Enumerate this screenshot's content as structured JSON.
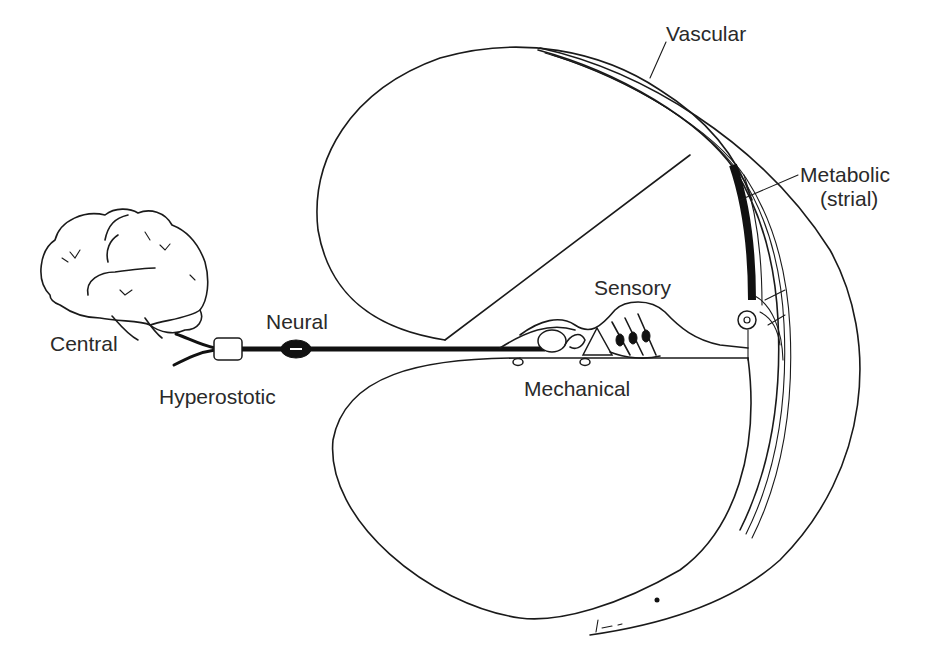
{
  "figure": {
    "labels": {
      "vascular": "Vascular",
      "metabolic_line1": "Metabolic",
      "metabolic_line2": "(strial)",
      "sensory": "Sensory",
      "neural": "Neural",
      "central": "Central",
      "hyperostotic": "Hyperostotic",
      "mechanical": "Mechanical"
    },
    "colors": {
      "background": "#ffffff",
      "ink": "#1a1a1a",
      "label_text": "#2a2a2a"
    }
  }
}
